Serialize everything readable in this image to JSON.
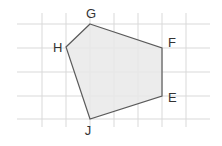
{
  "diagram": {
    "type": "polygon-on-grid",
    "colors": {
      "background": "#ffffff",
      "grid": "#d9d9d9",
      "fill": "#e9e9e9",
      "stroke": "#5a5a5a",
      "label": "#333333"
    },
    "grid": {
      "vertical_x": [
        42,
        66,
        90,
        114,
        138,
        162,
        186
      ],
      "horizontal_y": [
        24,
        48,
        72,
        96,
        119
      ],
      "x_extent": [
        17,
        210
      ],
      "y_extent": [
        13,
        127
      ]
    },
    "vertices": [
      {
        "name": "G",
        "x": 90,
        "y": 24,
        "label_x": 91,
        "label_y": 18
      },
      {
        "name": "F",
        "x": 162,
        "y": 48,
        "label_x": 168,
        "label_y": 47
      },
      {
        "name": "E",
        "x": 162,
        "y": 96,
        "label_x": 168,
        "label_y": 102
      },
      {
        "name": "J",
        "x": 90,
        "y": 119,
        "label_x": 88,
        "label_y": 135
      },
      {
        "name": "H",
        "x": 66,
        "y": 47,
        "label_x": 53,
        "label_y": 52
      }
    ]
  }
}
